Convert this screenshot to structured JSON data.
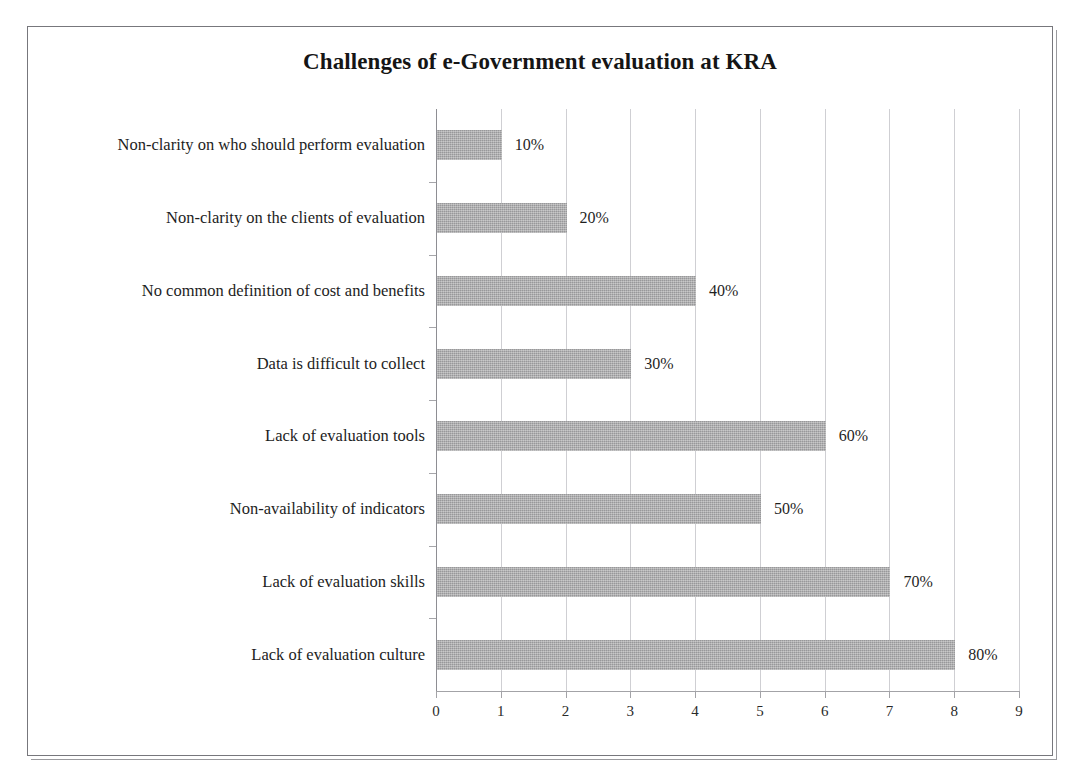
{
  "scan_remnant": "",
  "chart_data": {
    "type": "bar",
    "orientation": "horizontal",
    "title": "Challenges of e-Government evaluation at KRA",
    "xlabel": "",
    "ylabel": "",
    "xlim": [
      0,
      9
    ],
    "xticks": [
      "0",
      "1",
      "2",
      "3",
      "4",
      "5",
      "6",
      "7",
      "8",
      "9"
    ],
    "grid": true,
    "legend": "none",
    "bar_color": "#aaaaac",
    "categories": [
      "Non-clarity on who should perform evaluation",
      "Non-clarity on the clients of evaluation",
      "No common definition of cost and benefits",
      "Data is difficult to collect",
      "Lack of evaluation tools",
      "Non-availability of indicators",
      "Lack of evaluation skills",
      "Lack of evaluation culture"
    ],
    "values": [
      1,
      2,
      4,
      3,
      6,
      5,
      7,
      8
    ],
    "data_labels": [
      "10%",
      "20%",
      "40%",
      "30%",
      "60%",
      "50%",
      "70%",
      "80%"
    ]
  }
}
